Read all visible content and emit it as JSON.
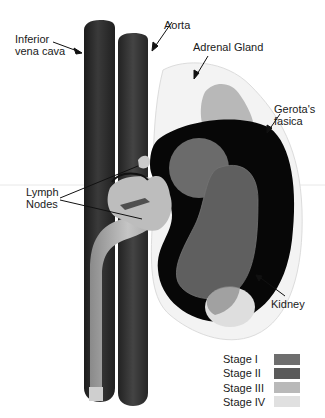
{
  "figure": {
    "type": "anatomical-diagram"
  },
  "labels": {
    "ivc": "Inferior\nvena cava",
    "aorta": "Aorta",
    "adrenal": "Adrenal Gland",
    "gerota": "Gerota's\nfasica",
    "lymph": "Lymph\nNodes",
    "kidney": "Kidney"
  },
  "legend": {
    "items": [
      {
        "label": "Stage I",
        "color": "#6e6e6e"
      },
      {
        "label": "Stage II",
        "color": "#5a5a5a"
      },
      {
        "label": "Stage III",
        "color": "#b9b9b9"
      },
      {
        "label": "Stage IV",
        "color": "#e0e0e0"
      }
    ]
  },
  "colors": {
    "vessel": "#2b2b2b",
    "kidney_cortex": "#050505",
    "gerota": "#f2f2f2",
    "adrenal": "#b5b5b5",
    "stage1": "#6e6e6e",
    "stage2": "#5a5a5a",
    "stage3": "#b9b9b9",
    "stage4": "#e0e0e0"
  }
}
